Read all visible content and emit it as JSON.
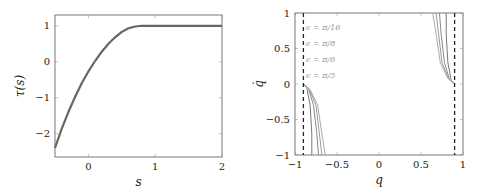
{
  "chart_data": [
    {
      "type": "line",
      "title": "",
      "xlabel": "s",
      "ylabel": "τ(s)",
      "xlim": [
        -0.5,
        2
      ],
      "ylim": [
        -2.65,
        1.3
      ],
      "xticks": [
        0,
        1,
        2
      ],
      "xtick_labels": [
        "0",
        "1",
        "2"
      ],
      "yticks": [
        1,
        0,
        -1,
        -2
      ],
      "ytick_labels": [
        "1",
        "0",
        "−1",
        "−2"
      ],
      "grid": false,
      "series": [
        {
          "name": "tau",
          "color": "#666666",
          "x": [
            -0.5,
            -0.4,
            -0.3,
            -0.2,
            -0.1,
            0.0,
            0.1,
            0.2,
            0.3,
            0.4,
            0.5,
            0.6,
            0.7,
            0.8,
            0.9,
            1.0,
            1.25,
            1.5,
            1.75,
            2.0
          ],
          "y": [
            -2.4,
            -1.87,
            -1.4,
            -0.98,
            -0.6,
            -0.27,
            0.02,
            0.28,
            0.5,
            0.68,
            0.83,
            0.93,
            0.98,
            1.0,
            1.0,
            1.0,
            1.0,
            1.0,
            1.0,
            1.0
          ]
        }
      ]
    },
    {
      "type": "line",
      "title": "",
      "xlabel": "q",
      "ylabel": "q̇",
      "xlim": [
        -1,
        1
      ],
      "ylim": [
        -1,
        1
      ],
      "xticks": [
        -1,
        -0.5,
        0,
        0.5,
        1
      ],
      "xtick_labels": [
        "−1",
        "−0.5",
        "0",
        "0.5",
        "1"
      ],
      "yticks": [
        1,
        0.5,
        0,
        -0.5,
        -1
      ],
      "ytick_labels": [
        "1",
        "0.5",
        "0",
        "−0.5",
        "−1"
      ],
      "grid": false,
      "legend": {
        "placement": "top-left",
        "entries": [
          "ϵ = π/16",
          "ϵ = π/8",
          "ϵ = π/6",
          "ϵ = π/5"
        ]
      },
      "reference_lines": [
        {
          "name": "left-limit",
          "x": -0.9,
          "style": "dashed",
          "color": "#222222"
        },
        {
          "name": "right-limit",
          "x": 0.9,
          "style": "dashed",
          "color": "#222222"
        }
      ],
      "series": [
        {
          "name": "ϵ = π/16",
          "color": "#777777",
          "left": {
            "x": [
              -0.9,
              -0.86,
              -0.82,
              -0.8,
              -0.8
            ],
            "y": [
              0,
              -0.05,
              -0.3,
              -0.7,
              -1
            ]
          },
          "right": {
            "x": [
              0.9,
              0.86,
              0.82,
              0.8,
              0.8
            ],
            "y": [
              0,
              0.05,
              0.3,
              0.7,
              1
            ]
          }
        },
        {
          "name": "ϵ = π/8",
          "color": "#888888",
          "left": {
            "x": [
              -0.9,
              -0.84,
              -0.78,
              -0.74,
              -0.72
            ],
            "y": [
              0,
              -0.06,
              -0.3,
              -0.7,
              -1
            ]
          },
          "right": {
            "x": [
              0.9,
              0.84,
              0.78,
              0.74,
              0.72
            ],
            "y": [
              0,
              0.06,
              0.3,
              0.7,
              1
            ]
          }
        },
        {
          "name": "ϵ = π/6",
          "color": "#999999",
          "left": {
            "x": [
              -0.9,
              -0.83,
              -0.75,
              -0.71,
              -0.68
            ],
            "y": [
              0,
              -0.07,
              -0.3,
              -0.7,
              -1
            ]
          },
          "right": {
            "x": [
              0.9,
              0.83,
              0.75,
              0.71,
              0.68
            ],
            "y": [
              0,
              0.07,
              0.3,
              0.7,
              1
            ]
          }
        },
        {
          "name": "ϵ = π/5",
          "color": "#aaaaaa",
          "left": {
            "x": [
              -0.9,
              -0.82,
              -0.73,
              -0.68,
              -0.64
            ],
            "y": [
              0,
              -0.08,
              -0.3,
              -0.7,
              -1
            ]
          },
          "right": {
            "x": [
              0.9,
              0.82,
              0.73,
              0.68,
              0.64
            ],
            "y": [
              0,
              0.08,
              0.3,
              0.7,
              1
            ]
          }
        }
      ]
    }
  ]
}
